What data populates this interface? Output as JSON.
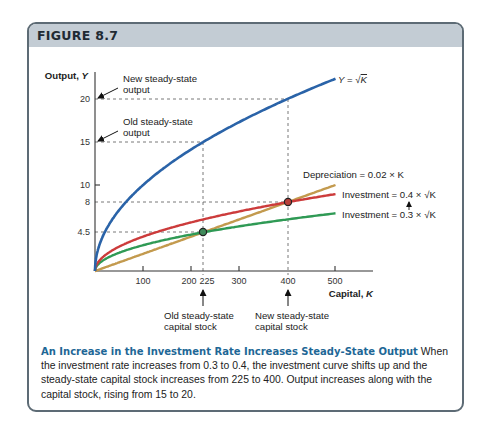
{
  "figure": {
    "title": "FIGURE 8.7",
    "frame_color": "#5d6b75",
    "header_color": "#c3ccd4"
  },
  "chart_data": {
    "type": "line",
    "title": "An Increase in the Investment Rate Increases Steady-State Output",
    "xlabel": "Capital, K",
    "ylabel": "Output, Y",
    "xlim": [
      0,
      520
    ],
    "ylim": [
      0,
      23
    ],
    "grid": false,
    "x_ticks": [
      100,
      200,
      225,
      300,
      400,
      500
    ],
    "y_ticks": [
      4.5,
      8,
      10,
      15,
      20
    ],
    "series": [
      {
        "name": "Y = √K",
        "formula": "sqrt(K)",
        "color": "#2a63a8",
        "x": [
          0,
          25,
          100,
          225,
          400,
          500
        ],
        "values": [
          0,
          5,
          10,
          15,
          20,
          22.36
        ]
      },
      {
        "name": "Investment = 0.4 × √K",
        "formula": "0.4*sqrt(K)",
        "color": "#cc3b3b",
        "x": [
          0,
          25,
          100,
          225,
          400,
          500
        ],
        "values": [
          0,
          2,
          4,
          6,
          8,
          8.94
        ]
      },
      {
        "name": "Investment = 0.3 × √K",
        "formula": "0.3*sqrt(K)",
        "color": "#2f9a55",
        "x": [
          0,
          25,
          100,
          225,
          400,
          500
        ],
        "values": [
          0,
          1.5,
          3,
          4.5,
          6,
          6.71
        ]
      },
      {
        "name": "Depreciation = 0.02 × K",
        "formula": "0.02*K",
        "color": "#c39a4e",
        "x": [
          0,
          100,
          225,
          400,
          500
        ],
        "values": [
          0,
          2,
          4.5,
          8,
          10
        ]
      }
    ],
    "steady_states": [
      {
        "name": "Old steady state",
        "K": 225,
        "investment": 4.5,
        "Y": 15
      },
      {
        "name": "New steady state",
        "K": 400,
        "investment": 8,
        "Y": 20
      }
    ],
    "annotations": [
      "New steady-state output",
      "Old steady-state output",
      "Old steady-state capital stock",
      "New steady-state capital stock"
    ],
    "legend_position": "inline-right"
  },
  "plot": {
    "y_axis_label": "Output, ",
    "y_axis_var": "Y",
    "x_axis_label": "Capital, ",
    "x_axis_var": "K",
    "y_tick_labels": [
      "20",
      "15",
      "10",
      "8",
      "4.5"
    ],
    "x_tick_labels": [
      "100",
      "200",
      "225",
      "300",
      "400",
      "500"
    ],
    "curve_label_output": "Y = √K",
    "label_depreciation": "Depreciation = 0.02 × K",
    "label_invest_new": "Investment = 0.4 × √K",
    "label_invest_old": "Investment = 0.3 × √K",
    "ann_new_output_1": "New steady-state",
    "ann_new_output_2": "output",
    "ann_old_output_1": "Old steady-state",
    "ann_old_output_2": "output",
    "ann_old_capital_1": "Old steady-state",
    "ann_old_capital_2": "capital stock",
    "ann_new_capital_1": "New steady-state",
    "ann_new_capital_2": "capital stock"
  },
  "caption": {
    "heading": "An Increase in the Investment Rate Increases Steady-State Output",
    "body": " When the investment rate increases from 0.3 to 0.4, the investment curve shifts up and the steady-state capital stock increases from 225 to 400. Output increases along with the capital stock, rising from 15 to 20."
  }
}
